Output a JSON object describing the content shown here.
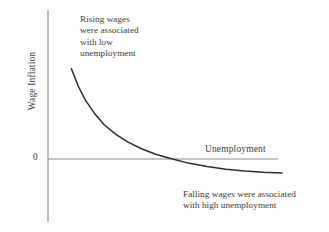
{
  "figure": {
    "background_color": "#fdfdfc",
    "ink_color": "#3a3835",
    "axis_color": "#8d8d8d",
    "curve_color": "#2f2d2b"
  },
  "axes": {
    "y_label": "Wage Inflation",
    "x_label": "Unemployment",
    "zero_tick": "0"
  },
  "annotations": {
    "upper": "Rising wages\nwere associated\nwith low\nunemployment",
    "lower": "Falling wages were associated\nwith high unemployment"
  },
  "chart_data": {
    "type": "line",
    "title": "",
    "subtitle": "",
    "xlabel": "Unemployment",
    "ylabel": "Wage Inflation",
    "grid": false,
    "legend": null,
    "xlim": [
      0,
      10
    ],
    "ylim": [
      -2,
      8
    ],
    "zero_line": 0,
    "series": [
      {
        "name": "Phillips curve",
        "x": [
          1.0,
          1.3,
          1.6,
          2.0,
          2.4,
          2.9,
          3.4,
          4.0,
          4.6,
          5.2,
          6.0,
          6.8,
          7.6,
          8.4,
          9.2,
          10.0
        ],
        "y": [
          6.6,
          5.3,
          4.3,
          3.3,
          2.5,
          1.8,
          1.25,
          0.75,
          0.35,
          0.05,
          -0.3,
          -0.55,
          -0.75,
          -0.88,
          -0.97,
          -1.02
        ]
      }
    ],
    "annotations": [
      {
        "text": "Rising wages were associated with low unemployment",
        "x": 2.2,
        "y": 6.6,
        "region": "upper-left"
      },
      {
        "text": "Falling wages were associated with high unemployment",
        "x": 6.8,
        "y": -1.6,
        "region": "lower-right"
      }
    ]
  }
}
